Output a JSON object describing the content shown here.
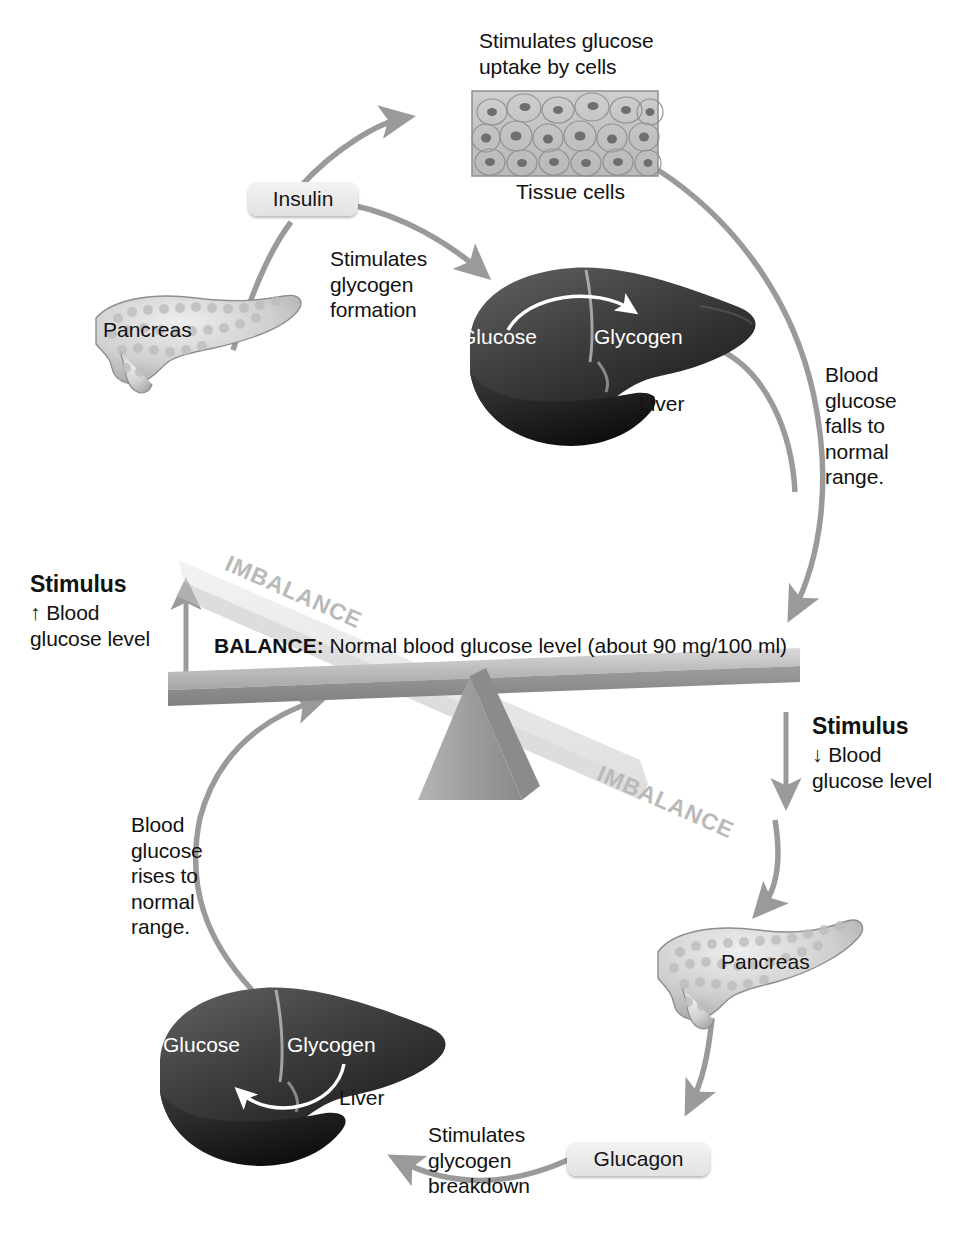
{
  "figure": {
    "accent_gray": "#9a9a9a",
    "text_color": "#121212",
    "chip_color": "#ebebeb",
    "imbalance_color": "#b9b9b9"
  },
  "top": {
    "uptake_text": "Stimulates glucose\nuptake by cells",
    "tissue_label": "Tissue cells",
    "insulin_chip": "Insulin",
    "pancreas_label": "Pancreas",
    "glycogen_formation_text": "Stimulates\nglycogen\nformation",
    "liver_label": "Liver",
    "glucose_label": "Glucose",
    "glycogen_label": "Glycogen",
    "falls_text": "Blood\nglucose\nfalls to\nnormal\nrange."
  },
  "balance": {
    "imbalance_upper": "IMBALANCE",
    "imbalance_lower": "IMBALANCE",
    "balance_bold": "BALANCE:",
    "balance_rest": " Normal blood glucose level (about 90 mg/100 ml)",
    "stimulus_left_head": "Stimulus",
    "stimulus_left_body": "↑ Blood\nglucose level",
    "stimulus_right_head": "Stimulus",
    "stimulus_right_body": "↓ Blood\nglucose level"
  },
  "bottom": {
    "rises_text": "Blood\nglucose\nrises to\nnormal\nrange.",
    "glucose_label": "Glucose",
    "glycogen_label": "Glycogen",
    "liver_label": "Liver",
    "breakdown_text": "Stimulates\nglycogen\nbreakdown",
    "glucagon_chip": "Glucagon",
    "pancreas_label": "Pancreas"
  }
}
